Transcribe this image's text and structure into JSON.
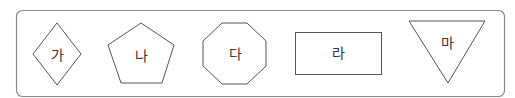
{
  "colors": {
    "frame_stroke": "#8a8a8a",
    "shape_stroke": "#555555",
    "text": "#333333",
    "background": "#ffffff"
  },
  "shapes": [
    {
      "name": "diamond",
      "label": "가",
      "label_pos": [
        57,
        55
      ]
    },
    {
      "name": "pentagon",
      "label": "나",
      "label_pos": [
        141,
        56
      ]
    },
    {
      "name": "octagon",
      "label": "다",
      "label_pos": [
        235,
        54
      ]
    },
    {
      "name": "rectangle",
      "label": "라",
      "label_pos": [
        338,
        53
      ]
    },
    {
      "name": "inverted-triangle",
      "label": "마",
      "label_pos": [
        447,
        43
      ]
    }
  ]
}
